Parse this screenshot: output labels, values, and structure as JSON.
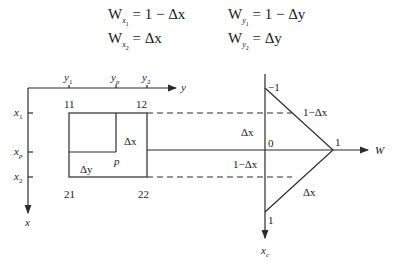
{
  "equations": [
    {
      "id": "wx1",
      "base": "W",
      "sub": "x",
      "subsub": "1",
      "rhs": "= 1 − Δx"
    },
    {
      "id": "wy1",
      "base": "W",
      "sub": "y",
      "subsub": "1",
      "rhs": "= 1 − Δy"
    },
    {
      "id": "wx2",
      "base": "W",
      "sub": "x",
      "subsub": "2",
      "rhs": "= Δx"
    },
    {
      "id": "wy2",
      "base": "W",
      "sub": "y",
      "subsub": "2",
      "rhs": "= Δy"
    }
  ],
  "left_panel": {
    "y_axis_label": "y",
    "x_axis_label": "x",
    "y_ticks": [
      {
        "label": "y",
        "sub": "1"
      },
      {
        "label": "y",
        "sub": "p"
      },
      {
        "label": "y",
        "sub": "2"
      }
    ],
    "x_ticks": [
      {
        "label": "x",
        "sub": "1"
      },
      {
        "label": "x",
        "sub": "p"
      },
      {
        "label": "x",
        "sub": "2"
      }
    ],
    "corners": {
      "c11": "11",
      "c12": "12",
      "c21": "21",
      "c22": "22"
    },
    "point_label": "p",
    "dx_label": "Δx",
    "dy_label": "Δy"
  },
  "right_panel": {
    "w_axis_label": "W",
    "xc_axis_label": "x",
    "xc_axis_sub": "c",
    "top_value": "−1",
    "origin": "0",
    "right_value": "1",
    "bottom_value": "1",
    "label_upper_right": "1−Δx",
    "label_upper_left": "Δx",
    "label_lower_left": "1−Δx",
    "label_lower_right": "Δx"
  }
}
